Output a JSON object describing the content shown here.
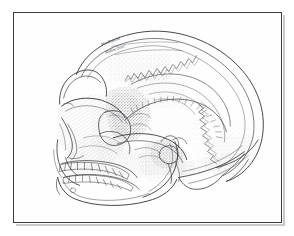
{
  "figure": {
    "orientation": "left lateral (norma lateralis), facing left",
    "medium": "pen-and-ink stipple and hatch line drawing",
    "background_color": "#fefefe",
    "ink_color": "#4a4a4e",
    "frame": {
      "border_color": "#3b3b3f",
      "shadow_color": "#c9c9cc",
      "border_width_px": 1.6,
      "left_px": 13,
      "top_px": 12,
      "width_px": 269,
      "height_px": 211
    },
    "annotations": [
      {
        "name": "handwritten-label-upper",
        "text": "Maxillofacial",
        "rotation_deg": -19
      },
      {
        "name": "handwritten-label-lower",
        "text": "Midline Trace",
        "rotation_deg": -19
      }
    ],
    "anatomical_parts": [
      "cranial vault",
      "frontal bone",
      "supraorbital torus",
      "orbit",
      "nasal aperture",
      "zygomatic arch",
      "maxilla",
      "maxillary tooth row",
      "mandible",
      "mandibular tooth row",
      "mandibular ramus",
      "temporal bone",
      "squamosal suture",
      "coronal suture",
      "lambdoid suture",
      "occipital bone",
      "nuchal torus",
      "mastoid process",
      "external auditory meatus"
    ]
  }
}
